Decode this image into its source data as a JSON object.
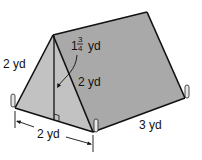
{
  "diagram": {
    "colors": {
      "front_face": "#c2c2c2",
      "side_face": "#a9a9a9",
      "edge": "#111111",
      "background": "#ffffff"
    },
    "labels": {
      "slant_left": "2 yd",
      "slant_right": "2 yd",
      "height_whole": "1",
      "height_num": "3",
      "height_den": "4",
      "height_unit": "yd",
      "base": "2 yd",
      "length": "3 yd"
    },
    "marks": {
      "right_angle_at_base": true,
      "height_arrow": true,
      "base_dimension_arrow": true
    }
  }
}
